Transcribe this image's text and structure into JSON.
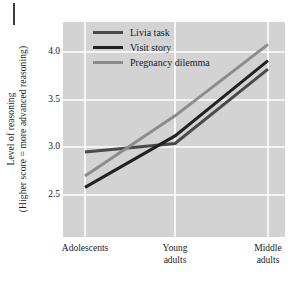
{
  "chart_data": {
    "type": "line",
    "title": "",
    "subtitle": "",
    "xlabel": "",
    "ylabel": "Level of reasoning (Higher score = more advanced reasoning)",
    "ylabel_lines": [
      "Level of reasoning",
      "(Higher score = more advanced reasoning)"
    ],
    "categories": [
      "Adolescents",
      "Young adults",
      "Middle adults"
    ],
    "category_lines": [
      [
        "Adolescents"
      ],
      [
        "Young",
        "adults"
      ],
      [
        "Middle",
        "adults"
      ]
    ],
    "yticks": [
      "2.5",
      "3.0",
      "3.5",
      "4.0"
    ],
    "ytick_values": [
      2.5,
      3.0,
      3.5,
      4.0
    ],
    "ylim": [
      2.28,
      4.22
    ],
    "grid": true,
    "legend_position": "top-left-inside",
    "series": [
      {
        "name": "Livia task",
        "color": "#4a4a4a",
        "values": [
          2.95,
          3.04,
          3.82
        ]
      },
      {
        "name": "Visit story",
        "color": "#222222",
        "values": [
          2.58,
          3.12,
          3.91
        ]
      },
      {
        "name": "Pregnancy dilemma",
        "color": "#8c8c8c",
        "values": [
          2.7,
          3.33,
          4.08
        ]
      }
    ]
  },
  "legend": {
    "items": [
      {
        "label": "Livia task",
        "color": "#4a4a4a",
        "swatch_name": "legend-swatch-livia-task"
      },
      {
        "label": "Visit story",
        "color": "#222222",
        "swatch_name": "legend-swatch-visit-story"
      },
      {
        "label": "Pregnancy dilemma",
        "color": "#8c8c8c",
        "swatch_name": "legend-swatch-pregnancy-dilemma"
      }
    ]
  },
  "axes": {
    "y_title_line1": "Level of reasoning",
    "y_title_line2": "(Higher score = more advanced reasoning)",
    "y_tick_0": "2.5",
    "y_tick_1": "3.0",
    "y_tick_2": "3.5",
    "y_tick_3": "4.0",
    "x_cat_0_line1": "Adolescents",
    "x_cat_1_line1": "Young",
    "x_cat_1_line2": "adults",
    "x_cat_2_line1": "Middle",
    "x_cat_2_line2": "adults"
  },
  "style": {
    "plot_background": "#d3d3d3",
    "grid_color": "#ffffff",
    "page_background": "#ffffff",
    "text_color": "#1a1a1a"
  }
}
